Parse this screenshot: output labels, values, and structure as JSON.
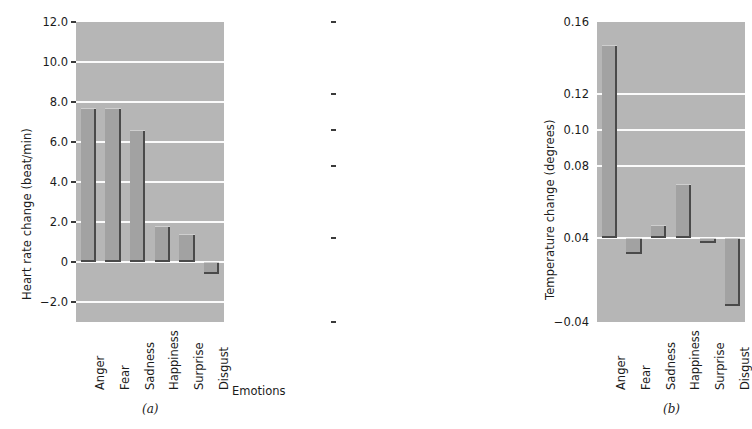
{
  "chart_data": [
    {
      "type": "bar",
      "panel_label": "(a)",
      "title": "",
      "xlabel": "Emotions",
      "ylabel": "Heart rate change (beat/min)",
      "categories": [
        "Anger",
        "Fear",
        "Sadness",
        "Happiness",
        "Surprise",
        "Disgust"
      ],
      "values": [
        7.7,
        7.7,
        6.6,
        1.8,
        1.4,
        -0.6
      ],
      "ylim": [
        -3.0,
        12.0
      ],
      "yticks": [
        12.0,
        10.0,
        8.0,
        6.0,
        4.0,
        2.0,
        0,
        -2.0
      ],
      "ytick_labels": [
        "12.0",
        "10.0",
        "8.0",
        "6.0",
        "4.0",
        "2.0",
        "0",
        "-2.0"
      ],
      "baseline": 0,
      "grid": true,
      "grid_color": "#fbfbfb",
      "legend": "none",
      "bar_color": "#a2a2a2",
      "plot_bg": "#b6b6b6"
    },
    {
      "type": "bar",
      "panel_label": "(b)",
      "title": "",
      "xlabel": "Emotions",
      "ylabel": "Temperature change (degrees)",
      "categories": [
        "Anger",
        "Fear",
        "Sadness",
        "Happiness",
        "Surprise",
        "Disgust"
      ],
      "values": [
        0.147,
        0.025,
        0.047,
        0.07,
        0.035,
        -0.025
      ],
      "ylim": [
        -0.04,
        0.16
      ],
      "yticks": [
        0.16,
        0.12,
        0.1,
        0.08,
        0.04,
        -0.04
      ],
      "ytick_labels": [
        "0.16",
        "0.12",
        "0.10",
        "0.08",
        "0.04",
        "-0.04"
      ],
      "ytick_positions_frac": [
        1.0,
        0.76,
        0.64,
        0.52,
        0.28,
        0.0
      ],
      "baseline": 0.04,
      "baseline_frac": 0.28,
      "grid": true,
      "grid_color": "#fbfbfb",
      "legend": "none",
      "bar_color": "#a2a2a2",
      "plot_bg": "#b6b6b6"
    }
  ],
  "shared": {
    "xaxis_title": "Emotions"
  }
}
